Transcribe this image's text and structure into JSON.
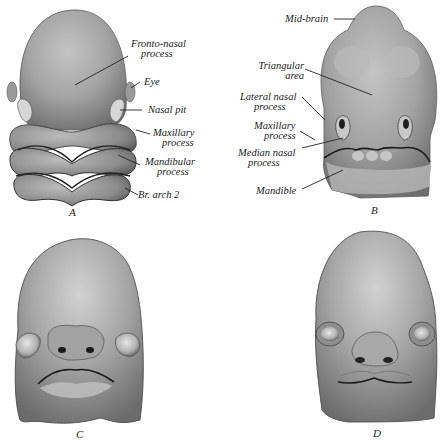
{
  "figure": {
    "panels": [
      {
        "id": "A",
        "letter": "A",
        "labels": {
          "fronto_nasal_1": "Fronto-nasal",
          "fronto_nasal_2": "process",
          "eye": "Eye",
          "nasal_pit": "Nasal pit",
          "maxillary_1": "Maxillary",
          "maxillary_2": "process",
          "mandibular_1": "Mandibular",
          "mandibular_2": "process",
          "br_arch": "Br. arch 2"
        }
      },
      {
        "id": "B",
        "letter": "B",
        "labels": {
          "mid_brain": "Mid-brain",
          "triangular_1": "Triangular",
          "triangular_2": "area",
          "lateral_nasal_1": "Lateral nasal",
          "lateral_nasal_2": "process",
          "maxillary_1": "Maxillary",
          "maxillary_2": "process",
          "median_nasal_1": "Median nasal",
          "median_nasal_2": "process",
          "mandible": "Mandible"
        }
      },
      {
        "id": "C",
        "letter": "C"
      },
      {
        "id": "D",
        "letter": "D"
      }
    ],
    "colors": {
      "background": "#ffffff",
      "tissue_light": "#bdbdbd",
      "tissue_mid": "#8f8f8f",
      "tissue_dark": "#4a4a4a",
      "leader_line": "#222222"
    }
  }
}
